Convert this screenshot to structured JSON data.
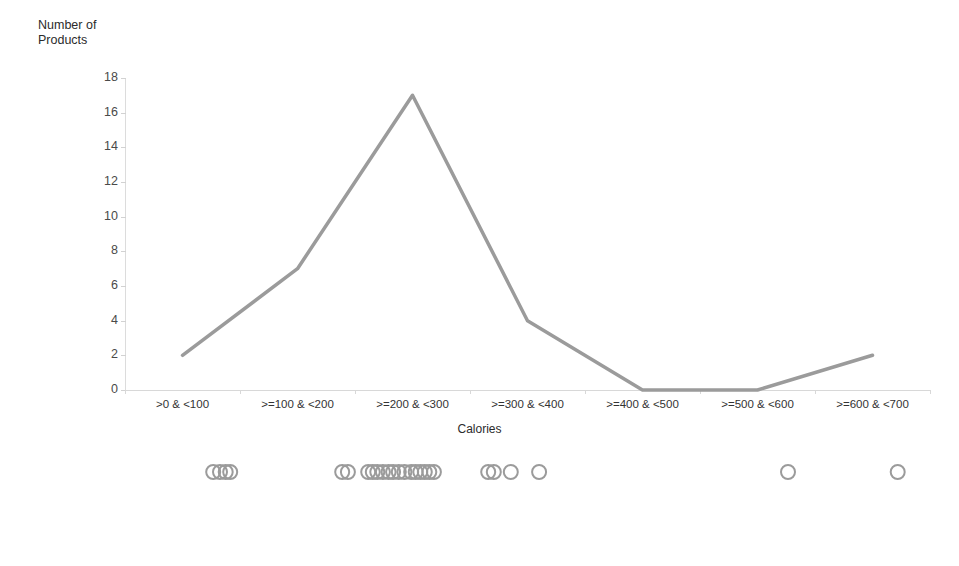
{
  "chart_data": [
    {
      "type": "line",
      "title": "",
      "xlabel": "Calories",
      "ylabel": "Number of\nProducts",
      "categories": [
        ">0 & <100",
        ">=100 & <200",
        ">=200 & <300",
        ">=300 & <400",
        ">=400 & <500",
        ">=500 & <600",
        ">=600 & <700"
      ],
      "values": [
        2,
        7,
        17,
        4,
        0,
        0,
        2
      ],
      "ylim": [
        0,
        18
      ],
      "y_ticks": [
        0,
        2,
        4,
        6,
        8,
        10,
        12,
        14,
        16,
        18
      ],
      "grid": false,
      "legend": "none",
      "line_color": "#9b9b9b",
      "line_width": 3.5
    },
    {
      "type": "scatter",
      "title": "",
      "xlabel": "Calories",
      "ylabel": "",
      "xlim": [
        0,
        700
      ],
      "x_ticks": [
        0,
        100,
        200,
        300,
        400,
        500,
        600,
        700
      ],
      "x_tick_labels": [
        "0",
        "100",
        "200",
        "300",
        "400",
        "500",
        "600",
        "700"
      ],
      "grid": false,
      "legend": "none",
      "marker": "open-circle",
      "marker_color": "#9b9b9b",
      "x": [
        93,
        99,
        104,
        108,
        207,
        212,
        230,
        234,
        238,
        243,
        248,
        252,
        257,
        262,
        268,
        272,
        276,
        280,
        284,
        288,
        336,
        341,
        356,
        381,
        601,
        698
      ]
    }
  ],
  "axes": {
    "line_chart": {
      "y_title": "Number of\nProducts",
      "x_title": "Calories"
    },
    "dot_chart": {
      "x_title": "Calories"
    }
  },
  "colors": {
    "series_line": "#9b9b9b",
    "marker_stroke": "#9b9b9b",
    "axis": "#d8d8d8",
    "text": "#333333"
  }
}
